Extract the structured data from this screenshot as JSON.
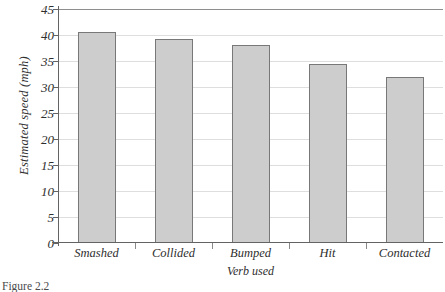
{
  "figure": {
    "caption": "Figure 2.2"
  },
  "chart_data": {
    "type": "bar",
    "title": "",
    "subtitle": "",
    "categories": [
      "Smashed",
      "Collided",
      "Bumped",
      "Hit",
      "Contacted"
    ],
    "values": [
      40.5,
      39.3,
      38.1,
      34.4,
      32.0
    ],
    "xlabel": "Verb used",
    "ylabel": "Estimated speed (mph)",
    "ylim": [
      0,
      45
    ],
    "ytick_labels": [
      "0",
      "5",
      "10",
      "15",
      "20",
      "25",
      "30",
      "35",
      "40",
      "45"
    ],
    "ytick_values": [
      0,
      5,
      10,
      15,
      20,
      25,
      30,
      35,
      40,
      45
    ],
    "grid": true,
    "grid_axis": "y",
    "legend": false,
    "bar_fill_color": "#cdcdcd",
    "bar_border_color": "#787878",
    "gridline_color": "#dedede",
    "axis_color": "#636363",
    "background_color": "#ffffff"
  }
}
